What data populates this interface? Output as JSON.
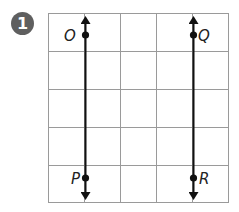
{
  "problem": {
    "number": "1"
  },
  "grid": {
    "columns": 5,
    "rows": 5,
    "line_color": "#9a9a9a"
  },
  "lines": [
    {
      "name": "line-OP",
      "points": [
        "O",
        "P"
      ],
      "column_position": 1
    },
    {
      "name": "line-QR",
      "points": [
        "Q",
        "R"
      ],
      "column_position": 4
    }
  ],
  "points": {
    "O": {
      "label": "O"
    },
    "P": {
      "label": "P"
    },
    "Q": {
      "label": "Q"
    },
    "R": {
      "label": "R"
    }
  },
  "colors": {
    "badge": "#5f5f5f",
    "line": "#111111",
    "grid": "#9a9a9a"
  }
}
